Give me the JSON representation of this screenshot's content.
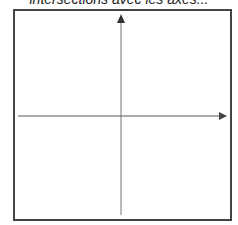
{
  "caption": "intersections avec les axes...",
  "diagram": {
    "frame": {
      "x": 14,
      "y": 10,
      "width": 217,
      "height": 210,
      "stroke": "#444444"
    },
    "x_axis": {
      "y": 116,
      "x_start": 18,
      "x_end": 226,
      "arrow": "right"
    },
    "y_axis": {
      "x": 121,
      "y_start": 215,
      "y_end": 14,
      "arrow": "up"
    },
    "axis_color": "#555555"
  }
}
